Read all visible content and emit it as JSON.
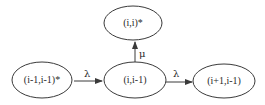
{
  "diagram": {
    "nodes": [
      {
        "id": "n_top",
        "label": "(i,i)*"
      },
      {
        "id": "n_left",
        "label": "(i-1,i-1)*"
      },
      {
        "id": "n_center",
        "label": "(i,i-1)"
      },
      {
        "id": "n_right",
        "label": "(i+1,i-1)"
      }
    ],
    "edges": [
      {
        "from": "n_left",
        "to": "n_center",
        "label": "λ"
      },
      {
        "from": "n_center",
        "to": "n_top",
        "label": "μ"
      },
      {
        "from": "n_center",
        "to": "n_right",
        "label": "λ"
      }
    ]
  }
}
